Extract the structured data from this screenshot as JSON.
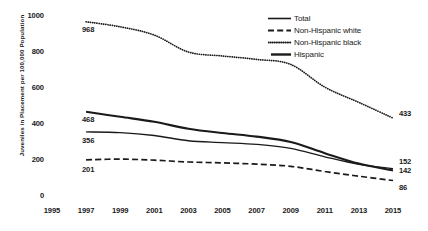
{
  "chart_data": {
    "type": "line",
    "title": "",
    "xlabel": "",
    "ylabel": "Juveniles in Placement per 100,000 Population",
    "xlim": [
      1995,
      2015
    ],
    "ylim": [
      0,
      1000
    ],
    "grid": false,
    "legend_position": "top-right",
    "x_ticks": [
      "1995",
      "1997",
      "1999",
      "2001",
      "2003",
      "2005",
      "2007",
      "2009",
      "2011",
      "2013",
      "2015"
    ],
    "y_ticks": [
      "0",
      "200",
      "400",
      "600",
      "800",
      "1000"
    ],
    "x": [
      1997,
      1999,
      2001,
      2003,
      2005,
      2007,
      2009,
      2011,
      2013,
      2015
    ],
    "series": [
      {
        "name": "Total",
        "style": "solid-thin",
        "values": [
          356,
          352,
          336,
          307,
          297,
          287,
          265,
          218,
          176,
          152
        ],
        "start_label": "356",
        "end_label": "152"
      },
      {
        "name": "Non-Hispanic white",
        "style": "dashed",
        "values": [
          201,
          205,
          199,
          189,
          184,
          177,
          165,
          136,
          110,
          86
        ],
        "start_label": "201",
        "end_label": "86"
      },
      {
        "name": "Non-Hispanic black",
        "style": "dotted",
        "values": [
          968,
          940,
          894,
          800,
          778,
          759,
          731,
          605,
          520,
          433
        ],
        "start_label": "968",
        "end_label": "433"
      },
      {
        "name": "Hispanic",
        "style": "solid-thick",
        "values": [
          468,
          440,
          412,
          374,
          350,
          330,
          300,
          238,
          180,
          142
        ],
        "start_label": "468",
        "end_label": "142"
      }
    ]
  },
  "legend": {
    "items": [
      {
        "label": "Total",
        "key": "solid-thin-key"
      },
      {
        "label": "Non-Hispanic white",
        "key": "dashed-key"
      },
      {
        "label": "Non-Hispanic black",
        "key": "dotted-key"
      },
      {
        "label": "Hispanic",
        "key": "solid-thick-key"
      }
    ]
  },
  "colors": {
    "line": "#1a1a1a",
    "text": "#1a1a1a",
    "background": "#ffffff"
  }
}
